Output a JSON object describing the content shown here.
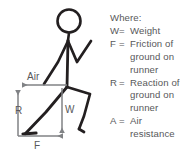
{
  "diagram": {
    "background_color": "#ffffff",
    "ink_color": "#231f20",
    "arrow_color": "#808285",
    "text_color": "#58585a",
    "vectors": [
      {
        "symbol": "Air",
        "name": "air-resistance-vector",
        "direction": "left",
        "label": "Air"
      },
      {
        "symbol": "R",
        "name": "reaction-vector",
        "direction": "up",
        "label": "R"
      },
      {
        "symbol": "W",
        "name": "weight-vector",
        "direction": "down",
        "label": "W"
      },
      {
        "symbol": "F",
        "name": "friction-vector",
        "direction": "right",
        "label": "F"
      }
    ]
  },
  "legend": {
    "heading": "Where:",
    "entries": [
      {
        "symbol": "W",
        "equals": "=",
        "text": "Weight",
        "continuation": []
      },
      {
        "symbol": "F",
        "equals": "=",
        "text": "Friction of",
        "continuation": [
          "ground on",
          "runner"
        ]
      },
      {
        "symbol": "R",
        "equals": "=",
        "text": "Reaction of",
        "continuation": [
          "ground on",
          "runner"
        ]
      },
      {
        "symbol": "A",
        "equals": "=",
        "text": "Air",
        "continuation": [
          "resistance"
        ]
      }
    ]
  }
}
